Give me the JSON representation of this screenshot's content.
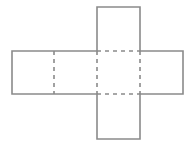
{
  "diagram": {
    "type": "cube-net",
    "stroke_color": "#8a8a8a",
    "faces": [
      {
        "name": "top",
        "x": 97,
        "y": 7,
        "w": 43,
        "h": 44
      },
      {
        "name": "left",
        "x": 12,
        "y": 51,
        "w": 42,
        "h": 43
      },
      {
        "name": "center-left",
        "x": 54,
        "y": 51,
        "w": 43,
        "h": 43
      },
      {
        "name": "center",
        "x": 97,
        "y": 51,
        "w": 43,
        "h": 43
      },
      {
        "name": "right",
        "x": 140,
        "y": 51,
        "w": 43,
        "h": 43
      },
      {
        "name": "bottom",
        "x": 97,
        "y": 94,
        "w": 43,
        "h": 45
      }
    ],
    "fold_lines": "dashed"
  }
}
